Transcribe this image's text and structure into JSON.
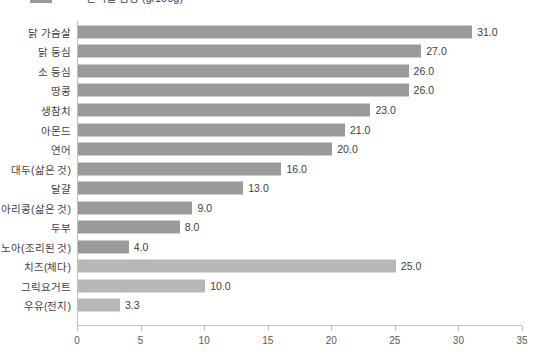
{
  "title": {
    "text": "단백질 함량 (g/100g)",
    "legend_label": "단백질"
  },
  "axis": {
    "x_ticks": [
      "0",
      "5",
      "10",
      "15",
      "20",
      "25",
      "30",
      "35"
    ]
  },
  "colors": {
    "bar_primary": "#9a9a9a",
    "bar_secondary": "#b7b7b7",
    "axis": "#bfbfbf",
    "text": "#3f3f3f"
  },
  "chart_data": {
    "type": "bar",
    "orientation": "horizontal",
    "title": "단백질 함량 (g/100g)",
    "xlabel": "",
    "ylabel": "",
    "xlim": [
      0,
      35
    ],
    "grid": false,
    "legend": false,
    "categories": [
      "닭 가슴살",
      "닭 등심",
      "소 등심",
      "땅콩",
      "생참치",
      "아몬드",
      "연어",
      "대두(삶은 것)",
      "달걀",
      "병아리콩(삶은 것)",
      "두부",
      "퀴노아(조리된 것)",
      "치즈(체다)",
      "그릭요거트",
      "우유(전지)"
    ],
    "values": [
      31.0,
      27.0,
      26.0,
      26.0,
      23.0,
      21.0,
      20.0,
      16.0,
      13.0,
      9.0,
      8.0,
      4.0,
      25.0,
      10.0,
      3.3
    ],
    "value_labels": [
      "31.0",
      "27.0",
      "26.0",
      "26.0",
      "23.0",
      "21.0",
      "20.0",
      "16.0",
      "13.0",
      "9.0",
      "8.0",
      "4.0",
      "25.0",
      "10.0",
      "3.3"
    ],
    "bar_groups": [
      "primary",
      "primary",
      "primary",
      "primary",
      "primary",
      "primary",
      "primary",
      "primary",
      "primary",
      "primary",
      "primary",
      "primary",
      "secondary",
      "secondary",
      "secondary"
    ]
  }
}
